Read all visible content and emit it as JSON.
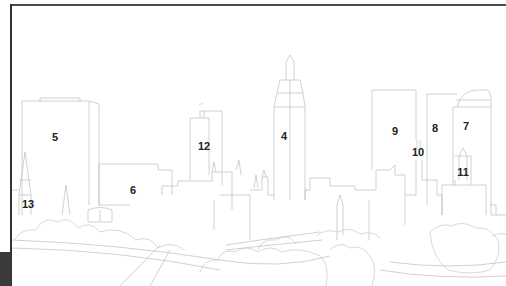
{
  "diagram": {
    "title": "",
    "style": "line-art city skyline with numbered building callouts",
    "colors": {
      "background": "#ffffff",
      "line": "#c4c4c4",
      "label": "#222222",
      "frame": "#4a4a4a",
      "corner_block": "#3a3a3a"
    },
    "labels": [
      {
        "id": "4",
        "text": "4",
        "x": 284,
        "y": 136
      },
      {
        "id": "5",
        "text": "5",
        "x": 55,
        "y": 137
      },
      {
        "id": "6",
        "text": "6",
        "x": 133,
        "y": 190
      },
      {
        "id": "7",
        "text": "7",
        "x": 466,
        "y": 126
      },
      {
        "id": "8",
        "text": "8",
        "x": 435,
        "y": 128
      },
      {
        "id": "9",
        "text": "9",
        "x": 395,
        "y": 131
      },
      {
        "id": "10",
        "text": "10",
        "x": 418,
        "y": 152
      },
      {
        "id": "11",
        "text": "11",
        "x": 463,
        "y": 172
      },
      {
        "id": "12",
        "text": "12",
        "x": 204,
        "y": 146
      },
      {
        "id": "13",
        "text": "13",
        "x": 28,
        "y": 204
      }
    ]
  }
}
